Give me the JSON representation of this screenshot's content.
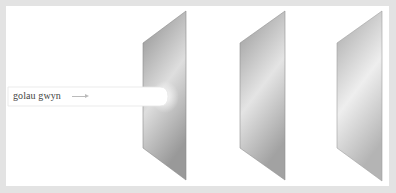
{
  "diagram": {
    "beam": {
      "label": "golau gwyn",
      "arrow": "right-arrow"
    },
    "panels": [
      {
        "id": "panel-1",
        "points": "143,43 186,11 186,180 143,148",
        "shade_top": "#8f8f8f",
        "shade_mid": "#dcdcdc",
        "shade_bottom": "#9a9a9a"
      },
      {
        "id": "panel-2",
        "points": "240,43 285,11 285,180 240,148",
        "shade_top": "#969696",
        "shade_mid": "#e2e2e2",
        "shade_bottom": "#a3a3a3"
      },
      {
        "id": "panel-3",
        "points": "337,43 382,11 382,181 337,148",
        "shade_top": "#a6a6a6",
        "shade_mid": "#ececec",
        "shade_bottom": "#b3b3b3"
      }
    ],
    "colors": {
      "frame": "#e3e3e3",
      "background": "#ffffff",
      "beam": "#ffffff"
    }
  }
}
